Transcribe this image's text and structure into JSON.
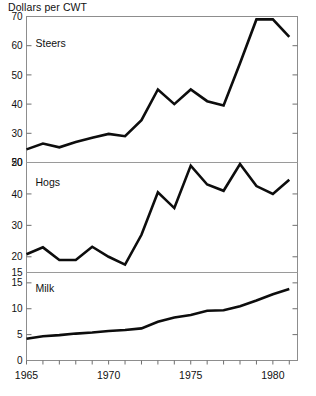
{
  "figure": {
    "unit_label": "Dollars per CWT",
    "x_axis": {
      "label": "",
      "ticks": [
        1965,
        1966,
        1967,
        1968,
        1969,
        1970,
        1971,
        1972,
        1973,
        1974,
        1975,
        1976,
        1977,
        1978,
        1979,
        1980,
        1981
      ],
      "labeled_ticks": [
        "1965",
        "1970",
        "1975",
        "1980"
      ],
      "labeled_values": [
        1965,
        1970,
        1975,
        1980
      ],
      "range": [
        1965,
        1981.5
      ]
    }
  },
  "chart_data": [
    {
      "type": "line",
      "title": "Steers",
      "xlabel": "",
      "ylabel": "Dollars per CWT",
      "ylim": [
        20,
        70
      ],
      "yticks": [
        20,
        30,
        40,
        50,
        60,
        70
      ],
      "ytick_labels": [
        "20",
        "30",
        "40",
        "50",
        "60",
        "70"
      ],
      "grid": false,
      "legend": "none",
      "x": [
        1965,
        1966,
        1967,
        1968,
        1969,
        1970,
        1971,
        1972,
        1973,
        1974,
        1975,
        1976,
        1977,
        1978,
        1979,
        1980,
        1981
      ],
      "values": [
        24.5,
        26.5,
        25.2,
        27.0,
        28.5,
        29.8,
        29.0,
        34.5,
        45.0,
        40.0,
        45.0,
        41.0,
        39.5,
        54.0,
        69.0,
        69.0,
        63.0
      ]
    },
    {
      "type": "line",
      "title": "Hogs",
      "xlabel": "",
      "ylabel": "Dollars per CWT",
      "ylim": [
        15,
        50
      ],
      "yticks": [
        15,
        20,
        30,
        40,
        50
      ],
      "ytick_labels": [
        "15",
        "20",
        "30",
        "40",
        "50"
      ],
      "grid": false,
      "legend": "none",
      "x": [
        1965,
        1966,
        1967,
        1968,
        1969,
        1970,
        1971,
        1972,
        1973,
        1974,
        1975,
        1976,
        1977,
        1978,
        1979,
        1980,
        1981
      ],
      "values": [
        20.8,
        23.0,
        19.0,
        19.0,
        23.2,
        20.0,
        17.5,
        27.0,
        40.5,
        35.5,
        49.0,
        43.0,
        41.0,
        49.5,
        42.5,
        40.0,
        44.5
      ]
    },
    {
      "type": "line",
      "title": "Milk",
      "xlabel": "",
      "ylabel": "Dollars per CWT",
      "ylim": [
        0,
        17
      ],
      "yticks": [
        0,
        5,
        10,
        15
      ],
      "ytick_labels": [
        "0",
        "5",
        "10",
        "15"
      ],
      "grid": false,
      "legend": "none",
      "x": [
        1965,
        1966,
        1967,
        1968,
        1969,
        1970,
        1971,
        1972,
        1973,
        1974,
        1975,
        1976,
        1977,
        1978,
        1979,
        1980,
        1981
      ],
      "values": [
        4.2,
        4.7,
        4.9,
        5.2,
        5.4,
        5.7,
        5.9,
        6.2,
        7.5,
        8.3,
        8.8,
        9.6,
        9.7,
        10.5,
        11.6,
        12.8,
        13.8
      ]
    }
  ]
}
